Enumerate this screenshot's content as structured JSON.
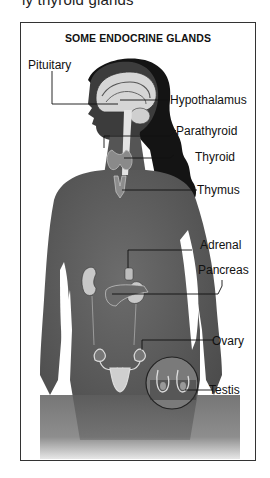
{
  "caption_fragment": "ly thyroid glands",
  "figure": {
    "title": "SOME ENDOCRINE GLANDS",
    "labels": {
      "pituitary": "Pituitary",
      "hypothalamus": "Hypothalamus",
      "parathyroid": "Parathyroid",
      "thyroid": "Thyroid",
      "thymus": "Thymus",
      "adrenal": "Adrenal",
      "pancreas": "Pancreas",
      "ovary": "Ovary",
      "testis": "Testis"
    }
  },
  "colors": {
    "body": "#5e5e5e",
    "hair": "#141414",
    "organ": "#d9d9d9",
    "frame": "#333333"
  }
}
